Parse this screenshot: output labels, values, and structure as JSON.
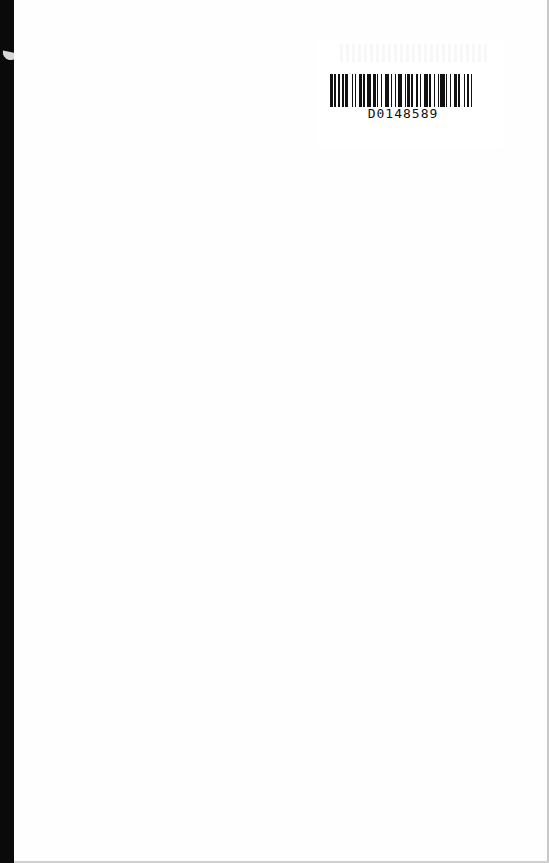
{
  "document": {
    "type": "scanned-book-page",
    "barcode": {
      "number": "D0148589",
      "bars": [
        2,
        1,
        1,
        2,
        1,
        2,
        1,
        1,
        2,
        3,
        1,
        1,
        1,
        2,
        2,
        1,
        1,
        2,
        3,
        1,
        2,
        1,
        1,
        2,
        1,
        2,
        3,
        1,
        1,
        2,
        1,
        1,
        3,
        2,
        1,
        1,
        2,
        1,
        1,
        2,
        2,
        1,
        1,
        2,
        3,
        1,
        1,
        2,
        1,
        2,
        1,
        1,
        3,
        1,
        1,
        2,
        1,
        2,
        2,
        1,
        1,
        3,
        1,
        1,
        2,
        1,
        1,
        2
      ]
    },
    "colors": {
      "spine": "#0a0a0a",
      "page": "#fefefe",
      "barcode_ink": "#111111"
    }
  }
}
